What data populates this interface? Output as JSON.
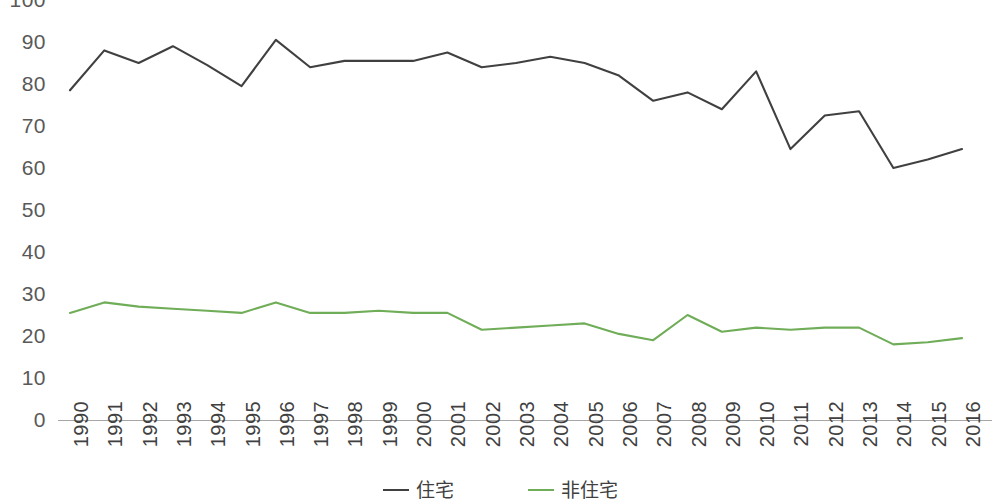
{
  "chart_data": {
    "type": "line",
    "title": "",
    "subtitle": "",
    "xlabel": "",
    "ylabel": "",
    "grid": false,
    "legend_position": "bottom-center",
    "ylim": [
      0,
      100
    ],
    "y_ticks": [
      "0",
      "10",
      "20",
      "30",
      "40",
      "50",
      "60",
      "70",
      "80",
      "90",
      "100"
    ],
    "categories": [
      "1990",
      "1991",
      "1992",
      "1993",
      "1994",
      "1995",
      "1996",
      "1997",
      "1998",
      "1999",
      "2000",
      "2001",
      "2002",
      "2003",
      "2004",
      "2005",
      "2006",
      "2007",
      "2008",
      "2009",
      "2010",
      "2011",
      "2012",
      "2013",
      "2014",
      "2015",
      "2016"
    ],
    "series": [
      {
        "name": "住宅",
        "color": "#404040",
        "values": [
          78.5,
          88.0,
          85.0,
          89.0,
          84.5,
          79.5,
          90.5,
          84.0,
          85.5,
          85.5,
          85.5,
          87.5,
          84.0,
          85.0,
          86.5,
          85.0,
          82.0,
          76.0,
          78.0,
          74.0,
          83.0,
          64.5,
          72.5,
          73.5,
          60.0,
          62.0,
          64.5
        ]
      },
      {
        "name": "非住宅",
        "color": "#70ad58",
        "values": [
          25.5,
          28.0,
          27.0,
          26.5,
          26.0,
          25.5,
          28.0,
          25.5,
          25.5,
          26.0,
          25.5,
          25.5,
          21.5,
          22.0,
          22.5,
          23.0,
          20.5,
          19.0,
          25.0,
          21.0,
          22.0,
          21.5,
          22.0,
          22.0,
          18.0,
          18.5,
          19.5
        ]
      }
    ]
  },
  "legend": {
    "items": [
      {
        "label": "住宅",
        "color": "#404040"
      },
      {
        "label": "非住宅",
        "color": "#70ad58"
      }
    ]
  },
  "colors": {
    "residential_line": "#404040",
    "nonresidential_line": "#70ad58",
    "axis": "#a6a6a6",
    "tick_text": "#595959",
    "background": "#ffffff"
  }
}
